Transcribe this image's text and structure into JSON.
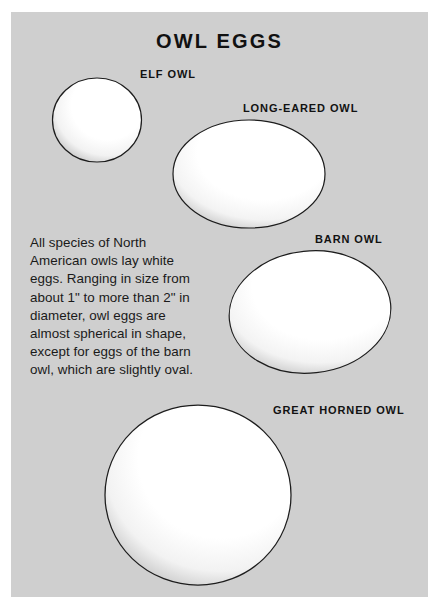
{
  "page": {
    "title": "OWL EGGS",
    "background_color": "#cfcfcf",
    "text_color": "#111111",
    "egg_fill_color": "#ffffff",
    "egg_outline_color": "#1a1a1a"
  },
  "description": "All species of North American owls lay white eggs. Ranging in size from about 1\" to more than 2\" in diameter, owl eggs are almost spherical in shape, except for eggs of the barn owl, which are slightly oval.",
  "eggs": [
    {
      "id": "elf-owl",
      "label": "ELF OWL",
      "shape": "nearly-spherical",
      "relative_size": "smallest"
    },
    {
      "id": "long-eared-owl",
      "label": "LONG-EARED OWL",
      "shape": "nearly-spherical",
      "relative_size": "medium"
    },
    {
      "id": "barn-owl",
      "label": "BARN OWL",
      "shape": "slightly-oval",
      "relative_size": "medium-large"
    },
    {
      "id": "great-horned-owl",
      "label": "GREAT HORNED OWL",
      "shape": "nearly-spherical",
      "relative_size": "largest"
    }
  ]
}
